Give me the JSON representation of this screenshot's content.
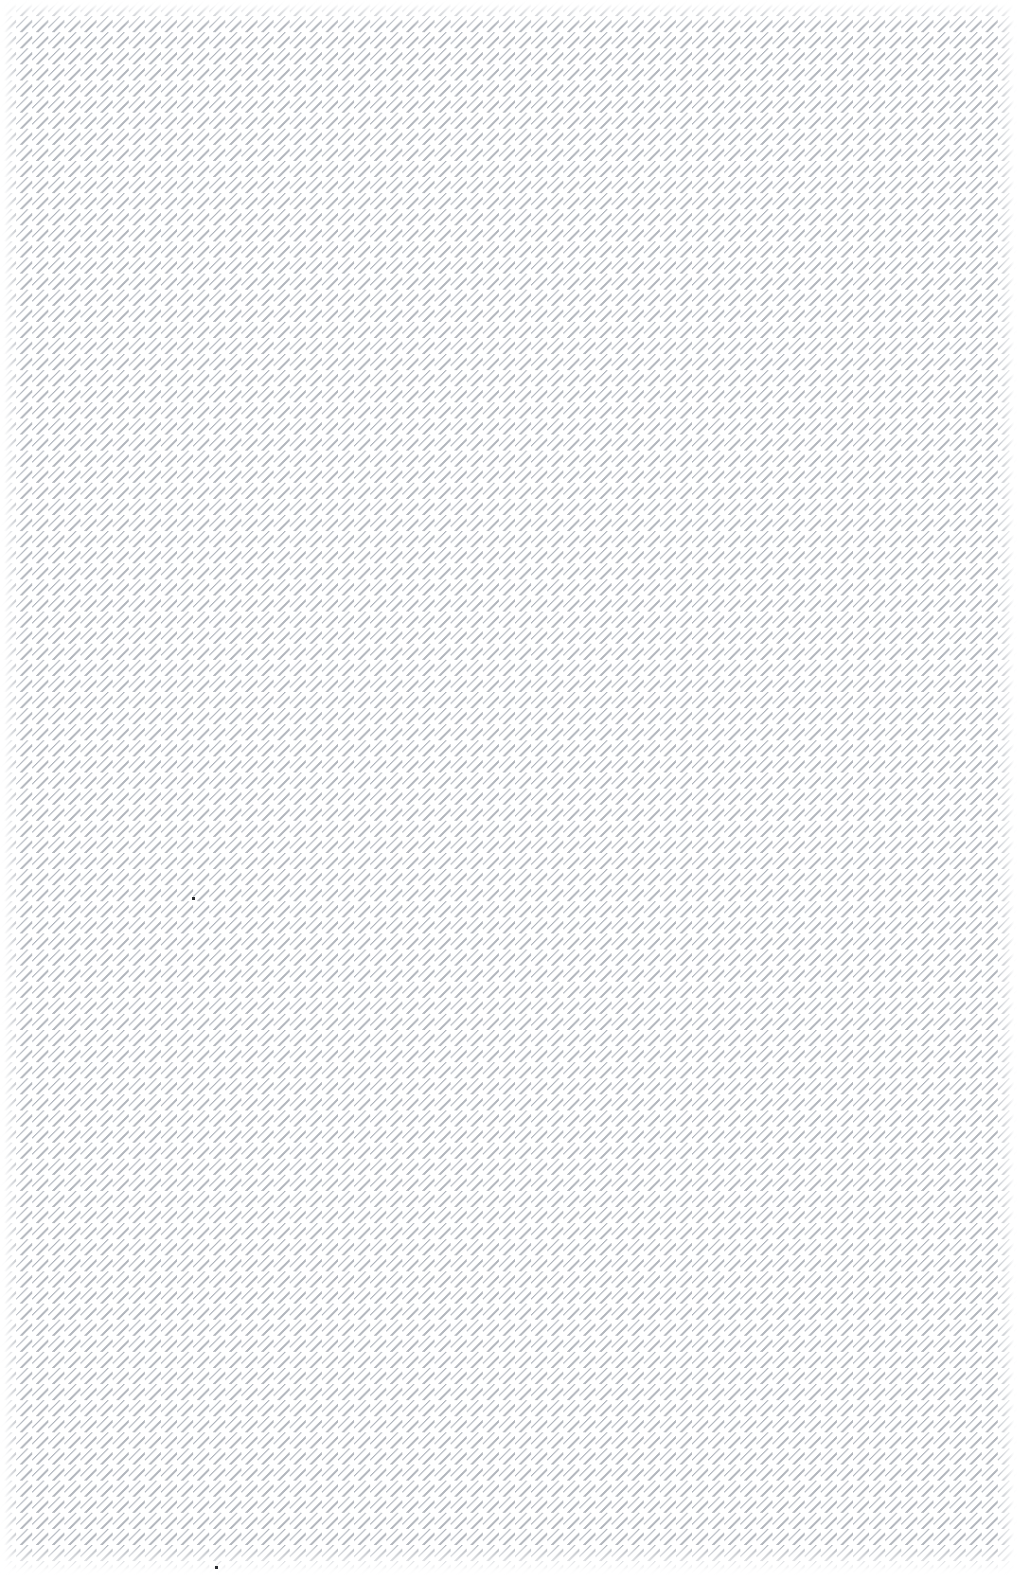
{
  "canvas": {
    "width": 1018,
    "height": 1575,
    "background_color": "#ffffff",
    "description": "Blank page filled edge-to-edge with a fine diagonal pinstripe texture"
  },
  "pattern": {
    "name": "diagonal-pinstripe",
    "type": "repeating-diagonal-lines",
    "direction": "down-right",
    "angle_degrees": 135,
    "line_color": "#b0b4bb",
    "line_color_dark": "#a9aeb6",
    "line_color_light": "#cdd1d7",
    "background_color": "#ffffff",
    "line_width_px": 1.2,
    "period_perpendicular_px": 8.05,
    "period_horizontal_px": 11.4,
    "period_vertical_px": 11.4,
    "approximate_line_count": 228,
    "coverage": "full-bleed"
  },
  "edge_fade": {
    "enabled": true,
    "color": "#ffffff",
    "top_px": 26,
    "bottom_px": 30,
    "left_px": 22,
    "right_px": 22
  },
  "marks": [
    {
      "label": "speck-upper",
      "x": 192,
      "y": 897,
      "size_px": 3,
      "color": "#2b2d31"
    },
    {
      "label": "speck-lower",
      "x": 215,
      "y": 1566,
      "size_px": 3,
      "color": "#2b2d31"
    }
  ],
  "text_content": []
}
